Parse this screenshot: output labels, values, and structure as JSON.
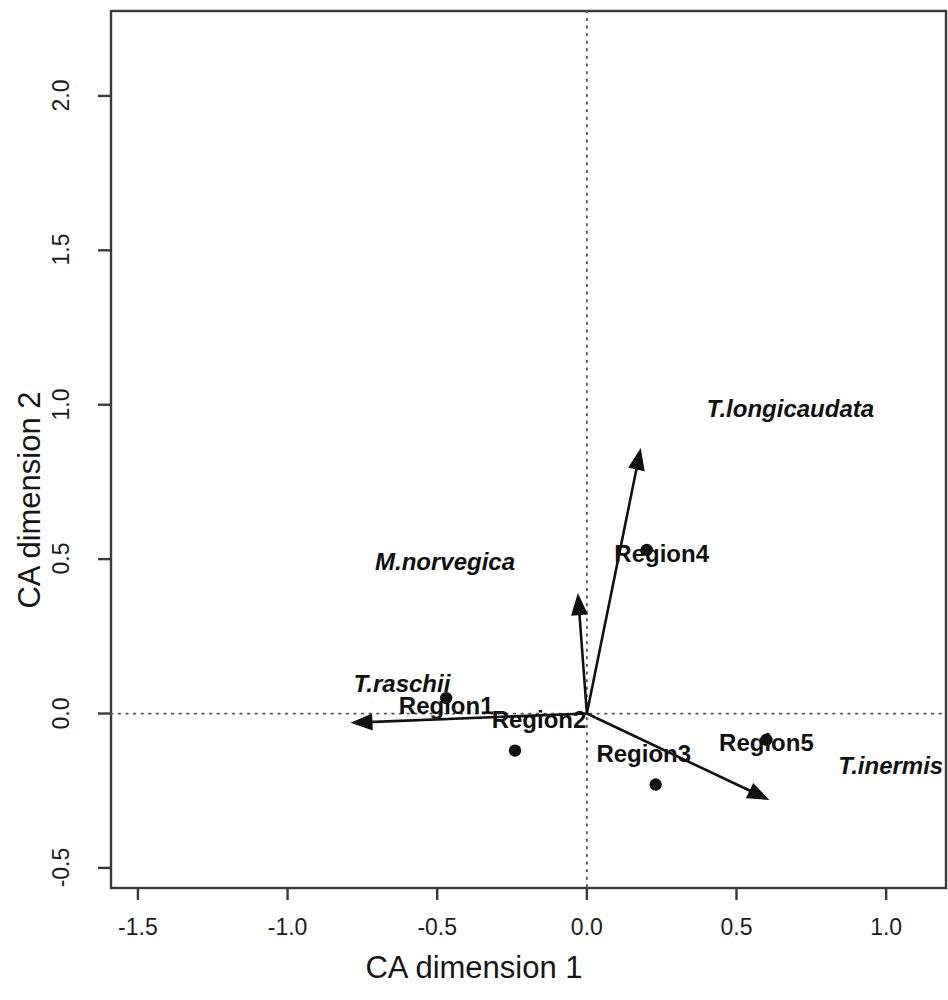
{
  "figure": {
    "kind": "correspondence-analysis-biplot",
    "xlabel": "CA dimension 1",
    "ylabel": "CA dimension 2",
    "frame_color": "#3a3a3a",
    "ink_color": "#111111",
    "reference_line_style": "dotted"
  },
  "axes": {
    "x_ticks": [
      "-1.5",
      "-1.0",
      "-0.5",
      "0.0",
      "0.5",
      "1.0"
    ],
    "x_tick_values": [
      -1.5,
      -1.0,
      -0.5,
      0.0,
      0.5,
      1.0
    ],
    "y_ticks": [
      "-0.5",
      "0.0",
      "0.5",
      "1.0",
      "1.5",
      "2.0"
    ],
    "y_tick_values": [
      -0.5,
      0.0,
      0.5,
      1.0,
      1.5,
      2.0
    ],
    "xlim": [
      -1.59,
      1.2
    ],
    "ylim": [
      -0.565,
      2.275
    ]
  },
  "chart_data": {
    "type": "scatter",
    "title": "",
    "xlabel": "CA dimension 1",
    "ylabel": "CA dimension 2",
    "xlim": [
      -1.59,
      1.2
    ],
    "ylim": [
      -0.565,
      2.275
    ],
    "grid": false,
    "legend": "none",
    "reference_lines": [
      {
        "type": "vline",
        "value": 0.0,
        "style": "dotted"
      },
      {
        "type": "hline",
        "value": 0.0,
        "style": "dotted"
      }
    ],
    "series": [
      {
        "name": "Regions (sites)",
        "marker": "filled-circle",
        "points": [
          {
            "label": "Region1",
            "x": -0.47,
            "y": 0.05,
            "label_dx": 0,
            "label_dy": -0.07
          },
          {
            "label": "Region2",
            "x": -0.24,
            "y": -0.12,
            "label_dx": 0.08,
            "label_dy": 0.055
          },
          {
            "label": "Region3",
            "x": 0.23,
            "y": -0.23,
            "label_dx": -0.04,
            "label_dy": 0.055
          },
          {
            "label": "Region4",
            "x": 0.2,
            "y": 0.53,
            "label_dx": 0.05,
            "label_dy": -0.06
          },
          {
            "label": "Region5",
            "x": 0.6,
            "y": -0.085,
            "label_dx": 0.0,
            "label_dy": -0.055
          }
        ]
      },
      {
        "name": "Species (arrows)",
        "marker": "arrow-from-origin",
        "points": [
          {
            "label": "T.longicaudata",
            "x": 0.18,
            "y": 0.86,
            "label_dx": 0.22,
            "label_dy": 0.08
          },
          {
            "label": "M.norvegica",
            "x": -0.03,
            "y": 0.39,
            "label_dx": -0.21,
            "label_dy": 0.055
          },
          {
            "label": "T.raschii",
            "x": -0.79,
            "y": -0.03,
            "label_dx": 0.01,
            "label_dy": 0.08
          },
          {
            "label": "T.inermis",
            "x": 0.61,
            "y": -0.28,
            "label_dx": 0.23,
            "label_dy": 0.065
          }
        ]
      }
    ]
  }
}
